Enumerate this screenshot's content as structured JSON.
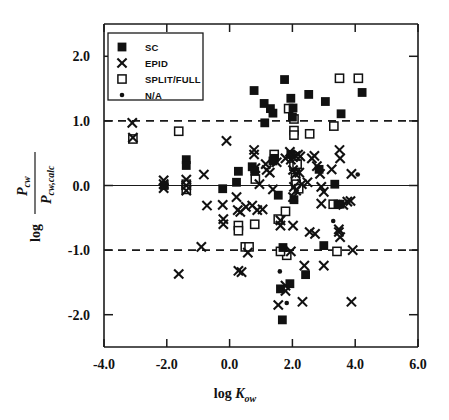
{
  "figure": {
    "background": "#ffffff",
    "ink": "#111111",
    "width": 449,
    "height": 420
  },
  "axes": {
    "x_label_main": "log",
    "x_label_sym": "K",
    "x_label_sub": "ow",
    "y_label_log": "log",
    "y_num_sym": "P",
    "y_num_sub": "cw",
    "y_den_sym": "P",
    "y_den_sub": "cw,calc",
    "x_ticklabels": [
      "-4.0",
      "-2.0",
      "0.0",
      "2.0",
      "4.0",
      "6.0"
    ],
    "x_tickvalues": [
      -4,
      -2,
      0,
      2,
      4,
      6
    ],
    "y_ticklabels": [
      "2.0",
      "1.0",
      "0.0",
      "-1.0",
      "-2.0"
    ],
    "y_tickvalues": [
      2,
      1,
      0,
      -1,
      -2
    ]
  },
  "legend": {
    "position": "top-left-inside",
    "entries": [
      {
        "label": "SC",
        "marker": "filled-square"
      },
      {
        "label": "EPID",
        "marker": "cross-x"
      },
      {
        "label": "SPLIT/FULL",
        "marker": "open-square"
      },
      {
        "label": "N/A",
        "marker": "small-dot"
      }
    ]
  },
  "chart_data": {
    "type": "scatter",
    "title": "",
    "xlabel": "log Kow",
    "ylabel": "log (Pcw / Pcw,calc)",
    "xlim": [
      -4.0,
      6.0
    ],
    "ylim": [
      -2.5,
      2.5
    ],
    "grid": false,
    "reference_lines": [
      {
        "y": 1.0,
        "style": "dashed",
        "label": "+1 log unit"
      },
      {
        "y": 0.0,
        "style": "solid",
        "label": "parity"
      },
      {
        "y": -1.0,
        "style": "dashed",
        "label": "-1 log unit"
      }
    ],
    "legend_position": "upper left",
    "series": [
      {
        "name": "SC",
        "marker": "filled-square",
        "points": [
          [
            -1.38,
            0.4
          ],
          [
            -1.38,
            0.31
          ],
          [
            -2.08,
            0.0
          ],
          [
            -0.22,
            -0.05
          ],
          [
            0.22,
            0.05
          ],
          [
            0.28,
            0.22
          ],
          [
            0.72,
            0.29
          ],
          [
            0.8,
            0.22
          ],
          [
            1.12,
            0.97
          ],
          [
            1.1,
            1.27
          ],
          [
            0.78,
            1.47
          ],
          [
            1.3,
            1.19
          ],
          [
            1.38,
            1.12
          ],
          [
            1.42,
            0.42
          ],
          [
            1.38,
            0.38
          ],
          [
            1.55,
            -0.15
          ],
          [
            1.75,
            1.64
          ],
          [
            1.95,
            1.35
          ],
          [
            2.0,
            1.06
          ],
          [
            2.05,
            -0.22
          ],
          [
            1.95,
            0.48
          ],
          [
            2.52,
            1.41
          ],
          [
            2.85,
            0.25
          ],
          [
            3.05,
            1.3
          ],
          [
            3.35,
            0.02
          ],
          [
            3.55,
            1.11
          ],
          [
            4.22,
            1.44
          ],
          [
            2.02,
            1.2
          ],
          [
            3.45,
            -0.29
          ],
          [
            3.52,
            -0.29
          ],
          [
            1.7,
            -0.96
          ],
          [
            3.0,
            -0.93
          ],
          [
            1.62,
            -1.6
          ],
          [
            1.92,
            -1.52
          ],
          [
            2.42,
            -1.38
          ],
          [
            1.68,
            -2.08
          ]
        ]
      },
      {
        "name": "SPLIT/FULL",
        "marker": "open-square",
        "points": [
          [
            -3.08,
            0.72
          ],
          [
            -1.62,
            0.84
          ],
          [
            -1.38,
            0.02
          ],
          [
            -1.38,
            -0.06
          ],
          [
            1.42,
            0.48
          ],
          [
            0.82,
            0.1
          ],
          [
            1.88,
            1.19
          ],
          [
            2.05,
            1.03
          ],
          [
            2.05,
            0.85
          ],
          [
            2.05,
            0.78
          ],
          [
            2.55,
            0.8
          ],
          [
            3.32,
            0.92
          ],
          [
            3.5,
            1.66
          ],
          [
            4.1,
            1.66
          ],
          [
            2.05,
            0.3
          ],
          [
            2.15,
            0.33
          ],
          [
            2.1,
            0.12
          ],
          [
            2.12,
            0.02
          ],
          [
            2.2,
            -0.05
          ],
          [
            0.28,
            -0.62
          ],
          [
            0.28,
            -0.7
          ],
          [
            0.8,
            -0.6
          ],
          [
            1.55,
            -0.52
          ],
          [
            1.78,
            -0.4
          ],
          [
            0.5,
            -0.95
          ],
          [
            0.62,
            -0.95
          ],
          [
            1.82,
            -1.08
          ],
          [
            3.3,
            -0.29
          ],
          [
            3.42,
            -1.02
          ],
          [
            1.62,
            -1.02
          ]
        ]
      },
      {
        "name": "N/A",
        "marker": "small-dot",
        "points": [
          [
            4.08,
            0.17
          ],
          [
            3.3,
            -0.55
          ],
          [
            1.6,
            -1.33
          ],
          [
            1.82,
            -1.82
          ]
        ]
      },
      {
        "name": "EPID",
        "marker": "cross-x",
        "points": [
          [
            -3.1,
            0.97
          ],
          [
            -3.08,
            0.74
          ],
          [
            -2.1,
            0.08
          ],
          [
            -2.1,
            0.02
          ],
          [
            -2.1,
            -0.04
          ],
          [
            -1.38,
            0.09
          ],
          [
            -1.38,
            0.0
          ],
          [
            -1.38,
            -0.08
          ],
          [
            -0.82,
            0.17
          ],
          [
            -0.1,
            0.69
          ],
          [
            -0.72,
            -0.31
          ],
          [
            -0.22,
            -0.3
          ],
          [
            -0.2,
            -0.52
          ],
          [
            -0.2,
            -0.6
          ],
          [
            0.22,
            -0.18
          ],
          [
            0.26,
            -0.38
          ],
          [
            0.34,
            -0.41
          ],
          [
            0.52,
            -0.33
          ],
          [
            0.72,
            -0.31
          ],
          [
            0.78,
            0.55
          ],
          [
            0.78,
            0.48
          ],
          [
            0.82,
            0.27
          ],
          [
            0.88,
            -0.38
          ],
          [
            0.95,
            0.02
          ],
          [
            1.05,
            -0.37
          ],
          [
            1.15,
            0.33
          ],
          [
            1.18,
            0.24
          ],
          [
            1.28,
            0.2
          ],
          [
            1.38,
            -0.06
          ],
          [
            1.5,
            0.36
          ],
          [
            1.62,
            -0.54
          ],
          [
            1.62,
            -0.62
          ],
          [
            1.78,
            0.42
          ],
          [
            1.92,
            0.52
          ],
          [
            1.95,
            0.4
          ],
          [
            2.02,
            0.44
          ],
          [
            2.1,
            0.46
          ],
          [
            2.18,
            0.48
          ],
          [
            2.25,
            0.45
          ],
          [
            2.02,
            0.24
          ],
          [
            2.1,
            0.18
          ],
          [
            2.22,
            0.2
          ],
          [
            2.05,
            -0.02
          ],
          [
            2.12,
            -0.08
          ],
          [
            2.02,
            -0.18
          ],
          [
            2.3,
            0.02
          ],
          [
            2.48,
            0.05
          ],
          [
            2.62,
            0.42
          ],
          [
            2.7,
            0.46
          ],
          [
            2.78,
            0.3
          ],
          [
            2.88,
            0.18
          ],
          [
            2.92,
            -0.02
          ],
          [
            3.0,
            -0.1
          ],
          [
            2.92,
            -0.28
          ],
          [
            3.25,
            0.25
          ],
          [
            3.5,
            0.55
          ],
          [
            3.52,
            0.42
          ],
          [
            3.88,
            0.18
          ],
          [
            3.62,
            -0.3
          ],
          [
            3.75,
            -0.25
          ],
          [
            3.85,
            -0.24
          ],
          [
            2.55,
            -0.72
          ],
          [
            2.72,
            -0.75
          ],
          [
            3.48,
            -0.72
          ],
          [
            3.52,
            -0.8
          ],
          [
            3.48,
            -0.68
          ],
          [
            2.02,
            -0.62
          ],
          [
            -0.9,
            -0.95
          ],
          [
            0.58,
            -1.04
          ],
          [
            1.95,
            -1.02
          ],
          [
            3.92,
            -1.0
          ],
          [
            -1.62,
            -1.37
          ],
          [
            0.28,
            -1.32
          ],
          [
            0.38,
            -1.34
          ],
          [
            2.38,
            -1.24
          ],
          [
            3.0,
            -1.24
          ],
          [
            1.78,
            -1.55
          ],
          [
            1.78,
            -1.63
          ],
          [
            1.55,
            -1.85
          ],
          [
            2.32,
            -1.8
          ],
          [
            3.88,
            -1.8
          ]
        ]
      }
    ]
  }
}
